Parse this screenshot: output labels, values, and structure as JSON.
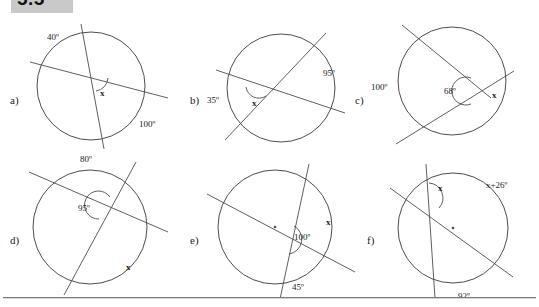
{
  "header": {
    "section_number": "5.5",
    "banner_color": "#c9c9c9"
  },
  "footer": {
    "rule_color": "#7b7b7b"
  },
  "worksheet": {
    "title": "Circle angle problems",
    "stroke_color": "#4d4d4d"
  },
  "panels": [
    {
      "letter": "a)",
      "labels": {
        "arc_upper_left": "40º",
        "arc_lower_right": "100º",
        "unknown": "x"
      }
    },
    {
      "letter": "b)",
      "labels": {
        "arc_left": "35º",
        "arc_right": "95º",
        "unknown": "x"
      }
    },
    {
      "letter": "c)",
      "labels": {
        "arc_left": "100º",
        "angle": "68º",
        "unknown": "x"
      }
    },
    {
      "letter": "d)",
      "labels": {
        "arc_top": "80º",
        "angle": "95º",
        "unknown": "x"
      }
    },
    {
      "letter": "e)",
      "labels": {
        "angle": "100º",
        "arc_bottom": "45º",
        "unknown": "x"
      }
    },
    {
      "letter": "f)",
      "labels": {
        "arc_upper_right": "x+26º",
        "arc_bottom": "92º",
        "unknown": "x"
      }
    }
  ]
}
